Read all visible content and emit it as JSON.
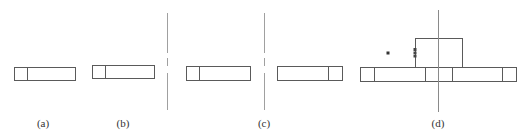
{
  "figure": {
    "panels": [
      {
        "id": "a",
        "label": "(a)",
        "label_x": 43
      },
      {
        "id": "b",
        "label": "(b)",
        "label_x": 123
      },
      {
        "id": "c",
        "label": "(c)",
        "label_x": 264
      },
      {
        "id": "d",
        "label": "(d)",
        "label_x": 438
      }
    ],
    "colors": {
      "stroke": "#555555",
      "axis": "#9a9a9a",
      "dot": "#333333"
    }
  }
}
